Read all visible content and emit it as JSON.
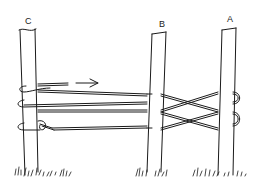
{
  "figure": {
    "type": "line-art illustration",
    "posts": [
      {
        "label": "C"
      },
      {
        "label": "B"
      },
      {
        "label": "A"
      }
    ],
    "arrow": {
      "direction": "right"
    },
    "colors": {
      "ink": "#1a1a1a",
      "background": "#ffffff"
    }
  }
}
